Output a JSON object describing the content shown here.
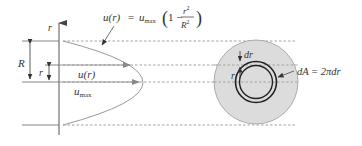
{
  "diagram": {
    "axis": {
      "label": "r"
    },
    "profile_equation": {
      "lhs": "u(r)",
      "equals": "=",
      "u": "u",
      "u_sub": "max",
      "open": "(",
      "one_minus": "1 −",
      "num": "r",
      "num_exp": "2",
      "den": "R",
      "den_exp": "2",
      "close": ")"
    },
    "dimensions": {
      "big_radius": "R",
      "small_radius": "r"
    },
    "velocity_labels": {
      "u_r": "u(r)",
      "u_max_base": "u",
      "u_max_sub": "max"
    },
    "cross_section": {
      "dr_label": "dr",
      "r_label": "r",
      "area_equation": "dA = 2πdr"
    },
    "colors": {
      "line": "#555555",
      "dashed": "#8a8a8a",
      "profile": "#9a9a9a",
      "disk_fill": "#dcdcdc",
      "disk_stroke": "#9a9a9a",
      "ring": "#222222"
    }
  }
}
